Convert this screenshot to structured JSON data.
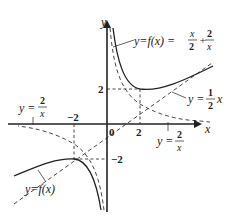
{
  "diagram": {
    "axes": {
      "x_label": "x",
      "y_label": "y",
      "origin_label": "0"
    },
    "ticks": {
      "x_pos": "2",
      "x_neg": "−2",
      "y_pos": "2",
      "y_neg": "−2"
    },
    "labels": {
      "f_top_lhs": "y=f(x) =",
      "f_top_num1": "x",
      "f_top_den1": "2",
      "f_top_plus": "+",
      "f_top_num2": "2",
      "f_top_den2": "x",
      "asymptote_lhs": "y =",
      "asymptote_num": "1",
      "asymptote_den": "2",
      "asymptote_var": "x",
      "recip_left_lhs": "y =",
      "recip_left_num": "2",
      "recip_left_den": "x",
      "recip_right_lhs": "y =",
      "recip_right_num": "2",
      "recip_right_den": "x",
      "f_bottom": "y=f(x)"
    },
    "colors": {
      "stroke": "#222222",
      "background": "#ffffff"
    }
  }
}
